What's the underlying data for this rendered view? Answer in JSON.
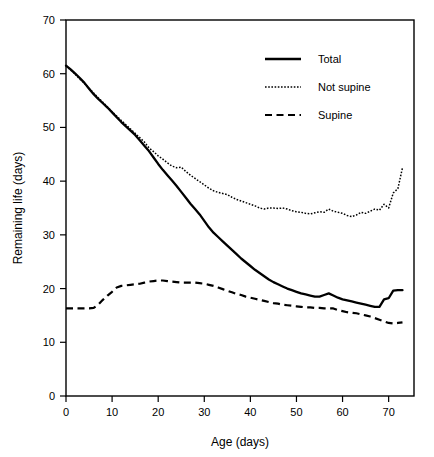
{
  "chart_data": {
    "type": "line",
    "title": "",
    "xlabel": "Age (days)",
    "ylabel": "Remaining life (days)",
    "xlim": [
      0,
      75.5
    ],
    "ylim": [
      0,
      70
    ],
    "xticks": [
      0,
      10,
      20,
      30,
      40,
      50,
      60,
      70
    ],
    "yticks": [
      0,
      10,
      20,
      30,
      40,
      50,
      60,
      70
    ],
    "xtick_labels": [
      "0",
      "10",
      "20",
      "30",
      "40",
      "50",
      "60",
      "70"
    ],
    "ytick_labels": [
      "0",
      "10",
      "20",
      "30",
      "40",
      "50",
      "60",
      "70"
    ],
    "grid": false,
    "legend_position": "top-right",
    "frame": "box",
    "line_color": "#000000",
    "background_color": "#ffffff",
    "series": [
      {
        "name": "Total",
        "style": "solid",
        "x": [
          0,
          1,
          2,
          3,
          4,
          5,
          6,
          7,
          8,
          9,
          10,
          11,
          12,
          13,
          14,
          15,
          16,
          17,
          18,
          19,
          20,
          21,
          22,
          23,
          24,
          25,
          26,
          27,
          28,
          29,
          30,
          31,
          32,
          33,
          34,
          35,
          36,
          37,
          38,
          39,
          40,
          41,
          42,
          43,
          44,
          45,
          46,
          47,
          48,
          49,
          50,
          51,
          52,
          53,
          54,
          55,
          56,
          57,
          58,
          59,
          60,
          61,
          62,
          63,
          64,
          65,
          66,
          67,
          68,
          69,
          70,
          71,
          72,
          73
        ],
        "values": [
          61.5,
          60.8,
          60.0,
          59.2,
          58.3,
          57.2,
          56.2,
          55.3,
          54.5,
          53.7,
          52.8,
          51.9,
          51.0,
          50.2,
          49.4,
          48.6,
          47.6,
          46.6,
          45.6,
          44.4,
          43.2,
          42.1,
          41.1,
          40.1,
          39.1,
          38.0,
          36.9,
          35.8,
          34.8,
          33.8,
          32.6,
          31.4,
          30.4,
          29.6,
          28.8,
          28.0,
          27.2,
          26.4,
          25.6,
          24.9,
          24.2,
          23.5,
          22.9,
          22.3,
          21.7,
          21.2,
          20.8,
          20.4,
          20.0,
          19.7,
          19.4,
          19.1,
          18.9,
          18.7,
          18.5,
          18.5,
          18.8,
          19.1,
          18.7,
          18.3,
          18.0,
          17.8,
          17.6,
          17.4,
          17.2,
          17.0,
          16.8,
          16.6,
          16.6,
          18.0,
          18.2,
          19.6,
          19.7,
          19.7
        ]
      },
      {
        "name": "Not supine",
        "style": "dotted",
        "x": [
          0,
          1,
          2,
          3,
          4,
          5,
          6,
          7,
          8,
          9,
          10,
          11,
          12,
          13,
          14,
          15,
          16,
          17,
          18,
          19,
          20,
          21,
          22,
          23,
          24,
          25,
          26,
          27,
          28,
          29,
          30,
          31,
          32,
          33,
          34,
          35,
          36,
          37,
          38,
          39,
          40,
          41,
          42,
          43,
          44,
          45,
          46,
          47,
          48,
          49,
          50,
          51,
          52,
          53,
          54,
          55,
          56,
          57,
          58,
          59,
          60,
          61,
          62,
          63,
          64,
          65,
          66,
          67,
          68,
          69,
          70,
          71,
          72,
          73
        ],
        "values": [
          61.5,
          60.7,
          59.9,
          59.0,
          58.2,
          57.3,
          56.4,
          55.5,
          54.7,
          53.8,
          52.9,
          52.1,
          51.3,
          50.5,
          49.7,
          48.9,
          48.1,
          47.3,
          46.2,
          45.5,
          44.7,
          44.1,
          43.4,
          42.8,
          42.5,
          42.6,
          41.8,
          41.1,
          40.5,
          39.9,
          39.3,
          38.7,
          38.2,
          37.9,
          37.7,
          37.5,
          37.0,
          36.6,
          36.3,
          36.0,
          35.7,
          35.4,
          35.0,
          34.8,
          35.0,
          35.0,
          34.9,
          35.0,
          34.8,
          34.5,
          34.3,
          34.2,
          34.0,
          33.9,
          34.1,
          34.3,
          34.2,
          34.8,
          34.4,
          34.2,
          34.0,
          33.6,
          33.4,
          33.7,
          34.2,
          34.0,
          34.4,
          34.8,
          34.6,
          35.7,
          35.0,
          37.8,
          38.6,
          42.5
        ]
      },
      {
        "name": "Supine",
        "style": "dashed",
        "x": [
          0,
          1,
          2,
          3,
          4,
          5,
          6,
          7,
          8,
          9,
          10,
          11,
          12,
          13,
          14,
          15,
          16,
          17,
          18,
          19,
          20,
          21,
          22,
          23,
          24,
          25,
          26,
          27,
          28,
          29,
          30,
          31,
          32,
          33,
          34,
          35,
          36,
          37,
          38,
          39,
          40,
          41,
          42,
          43,
          44,
          45,
          46,
          47,
          48,
          49,
          50,
          51,
          52,
          53,
          54,
          55,
          56,
          57,
          58,
          59,
          60,
          61,
          62,
          63,
          64,
          65,
          66,
          67,
          68,
          69,
          70,
          71,
          72,
          73
        ],
        "values": [
          16.3,
          16.3,
          16.3,
          16.3,
          16.3,
          16.3,
          16.4,
          17.0,
          17.9,
          18.7,
          19.4,
          20.2,
          20.5,
          20.6,
          20.7,
          20.8,
          20.9,
          21.1,
          21.3,
          21.4,
          21.5,
          21.5,
          21.4,
          21.3,
          21.2,
          21.1,
          21.1,
          21.1,
          21.1,
          21.0,
          20.9,
          20.7,
          20.5,
          20.2,
          19.9,
          19.6,
          19.3,
          19.0,
          18.8,
          18.5,
          18.3,
          18.1,
          17.9,
          17.7,
          17.5,
          17.3,
          17.2,
          17.0,
          16.9,
          16.8,
          16.7,
          16.6,
          16.5,
          16.5,
          16.4,
          16.4,
          16.3,
          16.3,
          16.3,
          16.0,
          15.8,
          15.6,
          15.5,
          15.4,
          15.2,
          15.0,
          14.8,
          14.5,
          14.2,
          13.9,
          13.6,
          13.5,
          13.6,
          13.7
        ]
      }
    ]
  },
  "legend": {
    "entries": [
      {
        "label": "Total",
        "style": "solid"
      },
      {
        "label": "Not supine",
        "style": "dotted"
      },
      {
        "label": "Supine",
        "style": "dashed"
      }
    ]
  }
}
